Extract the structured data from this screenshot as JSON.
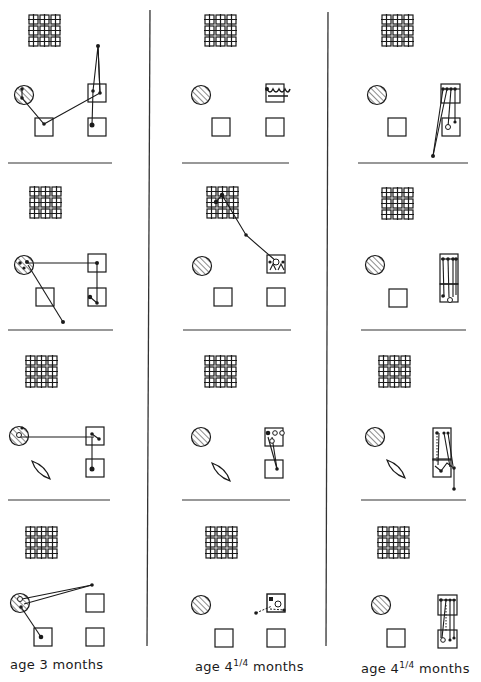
{
  "figure": {
    "type": "eye-movement scanpath diagram",
    "columns": [
      {
        "id": "col1",
        "caption": "age 3 months",
        "panels": [
          {
            "row": 1,
            "lower_left_shape": "square",
            "fixations": "circle -> left square -> right upper square -> above point; right upper square -> lower right square"
          },
          {
            "row": 2,
            "lower_left_shape": "square",
            "fixations": "circle -> upper right square -> lower right square; circle -> below point"
          },
          {
            "row": 3,
            "lower_left_shape": "lens",
            "fixations": "circle -> upper right square -> lower right square"
          },
          {
            "row": 4,
            "lower_left_shape": "square",
            "fixations": "circle -> point right; circle -> lower left square"
          }
        ]
      },
      {
        "id": "col2",
        "caption_prefix": "age 4",
        "caption_frac": "1/4",
        "caption_suffix": " months",
        "panels": [
          {
            "row": 1,
            "lower_left_shape": "square",
            "fixations": "clustered in upper right square"
          },
          {
            "row": 2,
            "lower_left_shape": "square",
            "fixations": "grid -> midpoint -> upper right square cluster"
          },
          {
            "row": 3,
            "lower_left_shape": "lens",
            "fixations": "upper right square cluster -> lower right square"
          },
          {
            "row": 4,
            "lower_left_shape": "square",
            "fixations": "clustered in upper right square, one point left"
          }
        ]
      },
      {
        "id": "col3",
        "caption_prefix": "age 4",
        "caption_frac": "1/4",
        "caption_suffix": " months",
        "panels": [
          {
            "row": 1,
            "lower_left_shape": "square",
            "fixations": "vertical sweeps upper right -> lower right, one point below"
          },
          {
            "row": 2,
            "lower_left_shape": "square",
            "fixations": "vertical sweeps upper right <-> lower right"
          },
          {
            "row": 3,
            "lower_left_shape": "lens",
            "fixations": "vertical sweeps upper right <-> lower right, point below"
          },
          {
            "row": 4,
            "lower_left_shape": "square",
            "fixations": "vertical sweeps upper right <-> lower right"
          }
        ]
      }
    ],
    "legend_shapes": [
      "grid-pattern",
      "hatched-circle",
      "square",
      "lens"
    ],
    "colors": {
      "ink": "#1a1a1a",
      "background": "#ffffff"
    }
  },
  "captions": {
    "col1": "age 3 months",
    "col2_main": "age 4",
    "col2_frac": "1/4",
    "col2_tail": " months",
    "col3_main": "age 4",
    "col3_frac": "1/4",
    "col3_tail": " months"
  }
}
